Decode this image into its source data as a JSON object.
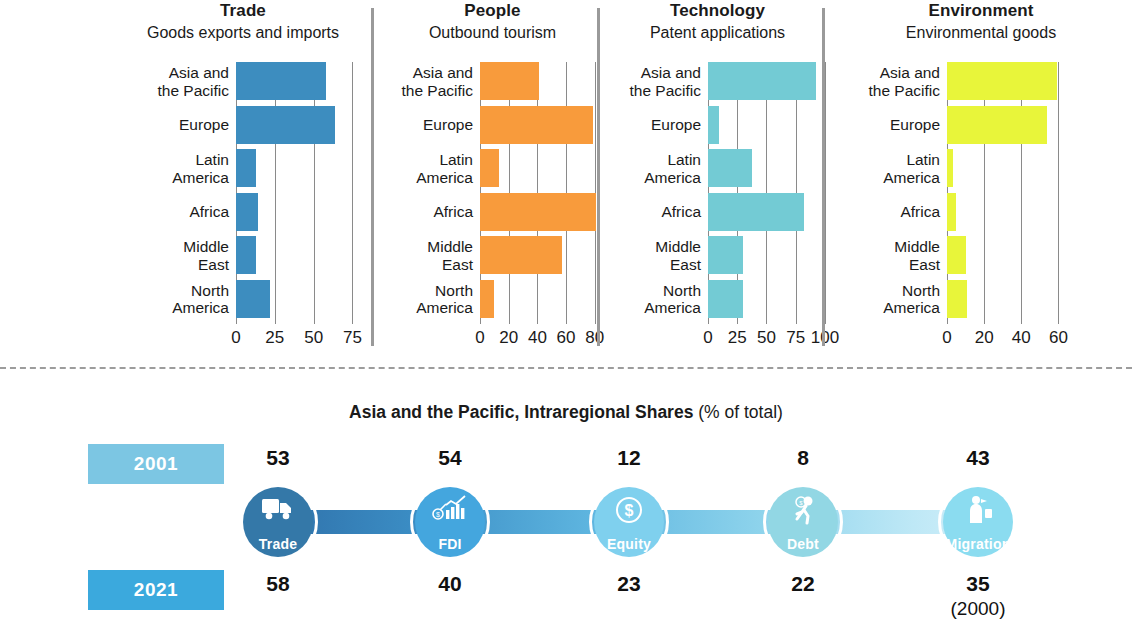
{
  "chart_data": [
    {
      "type": "bar",
      "title": "Trade",
      "subtitle": "Goods exports and imports",
      "orientation": "horizontal",
      "categories": [
        "Asia and the Pacific",
        "Europe",
        "Latin America",
        "Africa",
        "Middle East",
        "North America"
      ],
      "values": [
        58,
        64,
        13,
        14,
        13,
        22
      ],
      "xlabel": "",
      "ylabel": "",
      "xlim": [
        0,
        85
      ],
      "ticks": [
        "0",
        "25",
        "50",
        "75"
      ],
      "tick_values": [
        0,
        25,
        50,
        75
      ],
      "grid": true,
      "color": "#3D8DBF",
      "legend": "none"
    },
    {
      "type": "bar",
      "title": "People",
      "subtitle": "Outbound tourism",
      "orientation": "horizontal",
      "categories": [
        "Asia and the Pacific",
        "Europe",
        "Latin America",
        "Africa",
        "Middle East",
        "North America"
      ],
      "values": [
        41,
        79,
        13,
        81,
        57,
        10
      ],
      "xlabel": "",
      "ylabel": "",
      "xlim": [
        0,
        92
      ],
      "ticks": [
        "0",
        "20",
        "40",
        "60",
        "80"
      ],
      "tick_values": [
        0,
        20,
        40,
        60,
        80
      ],
      "grid": true,
      "color": "#F89B3C",
      "legend": "none"
    },
    {
      "type": "bar",
      "title": "Technology",
      "subtitle": "Patent applications",
      "orientation": "horizontal",
      "categories": [
        "Asia and the Pacific",
        "Europe",
        "Latin America",
        "Africa",
        "Middle East",
        "North America"
      ],
      "values": [
        92,
        9,
        38,
        82,
        30,
        30
      ],
      "xlabel": "",
      "ylabel": "",
      "xlim": [
        0,
        112
      ],
      "ticks": [
        "0",
        "25",
        "50",
        "75",
        "100"
      ],
      "tick_values": [
        0,
        25,
        50,
        75,
        100
      ],
      "grid": true,
      "color": "#73CBD4",
      "legend": "none"
    },
    {
      "type": "bar",
      "title": "Environment",
      "subtitle": "Environmental goods",
      "orientation": "horizontal",
      "categories": [
        "Asia and the Pacific",
        "Europe",
        "Latin America",
        "Africa",
        "Middle East",
        "North America"
      ],
      "values": [
        59,
        54,
        3,
        5,
        10,
        11
      ],
      "xlabel": "",
      "ylabel": "",
      "xlim": [
        0,
        70
      ],
      "ticks": [
        "0",
        "20",
        "40",
        "60"
      ],
      "tick_values": [
        0,
        20,
        40,
        60
      ],
      "grid": true,
      "color": "#E8F53A",
      "legend": "none"
    }
  ],
  "flow": {
    "title_bold": "Asia and the Pacific, Intraregional Shares ",
    "title_light": "(% of total)",
    "year_top": "2001",
    "year_bottom": "2021",
    "nodes": [
      {
        "label": "Trade",
        "icon": "truck-icon",
        "color": "#3478A8",
        "value_top": "53",
        "value_bottom": "58",
        "note": ""
      },
      {
        "label": "FDI",
        "icon": "bar-chart-icon",
        "color": "#44A6DE",
        "value_top": "54",
        "value_bottom": "40",
        "note": ""
      },
      {
        "label": "Equity",
        "icon": "dollar-coin-icon",
        "color": "#7FD0EE",
        "value_top": "12",
        "value_bottom": "23",
        "note": ""
      },
      {
        "label": "Debt",
        "icon": "running-man-icon",
        "color": "#92D7E4",
        "value_top": "8",
        "value_bottom": "22",
        "note": ""
      },
      {
        "label": "Migration",
        "icon": "person-bag-icon",
        "color": "#8BDCF0",
        "value_top": "43",
        "value_bottom": "35",
        "note": "(2000)"
      }
    ]
  },
  "colors": {
    "trade": "#3D8DBF",
    "people": "#F89B3C",
    "technology": "#73CBD4",
    "environment": "#E8F53A",
    "chip_2001": "#7CC6E3",
    "chip_2021": "#3BA9DD",
    "separator": "#9a9a9a",
    "gridline": "#8a8a8a"
  }
}
